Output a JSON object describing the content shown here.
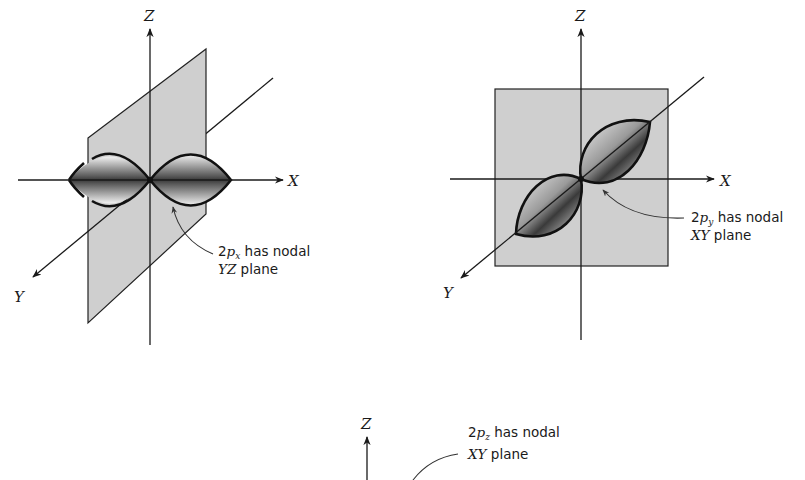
{
  "figure": {
    "colors": {
      "plane_fill": "#cfcfcf",
      "line": "#1a1a1a",
      "lobe_dark": "#3a3a3a",
      "lobe_light": "#f2f2f2",
      "background": "#ffffff"
    },
    "panels": [
      {
        "id": "2px",
        "axes": {
          "z": "Z",
          "x": "X",
          "y": "Y"
        },
        "callout": {
          "prefix": "2",
          "orbital": "p",
          "subscript": "x",
          "line1_rest": " has nodal",
          "line2_plane": "YZ",
          "line2_rest": " plane"
        }
      },
      {
        "id": "2py",
        "axes": {
          "z": "Z",
          "x": "X",
          "y": "Y"
        },
        "callout": {
          "prefix": "2",
          "orbital": "p",
          "subscript": "y",
          "line1_rest": " has nodal",
          "line2_plane": "XY",
          "line2_rest": " plane"
        }
      },
      {
        "id": "2pz",
        "axes": {
          "z": "Z"
        },
        "callout": {
          "prefix": "2",
          "orbital": "p",
          "subscript": "z",
          "line1_rest": " has nodal",
          "line2_plane": "XY",
          "line2_rest": " plane"
        }
      }
    ]
  }
}
